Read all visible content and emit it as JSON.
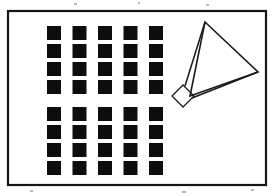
{
  "figure": {
    "title": "",
    "background_color": "#ffffff",
    "ink_color": "#111111",
    "canvas": {
      "width": 275,
      "height": 196
    },
    "frame": {
      "label": "outer-frame",
      "x": 8,
      "y": 11,
      "width": 258,
      "height": 174,
      "stroke_width": 2.2,
      "stroke_color": "#141414",
      "fill": "none"
    },
    "square_grid": {
      "label": "filled-square-grid",
      "columns": 5,
      "rows": 8,
      "square_size": 14,
      "column_pitch": 25.5,
      "row_pitch": 18,
      "origin_x": 47,
      "origin_y": 26,
      "block_gap": 9,
      "rows_per_block": 4,
      "blocks": 2,
      "fill_color": "#0d0d0d",
      "total_squares": 40
    },
    "triangle": {
      "label": "outlined-triangle",
      "points": [
        {
          "name": "apex",
          "x": 205,
          "y": 22
        },
        {
          "name": "right-vertex",
          "x": 258,
          "y": 72
        },
        {
          "name": "lower-left-vertex",
          "x": 190,
          "y": 96
        }
      ],
      "stroke_width": 1.6,
      "stroke_color": "#1a1a1a",
      "fill": "none"
    },
    "diamond": {
      "label": "rotated-square-marker",
      "center_x": 183,
      "center_y": 96,
      "half_diagonal": 11,
      "rotation_degrees": 45,
      "stroke_width": 1.3,
      "stroke_color": "#1a1a1a",
      "fill": "none"
    },
    "connector_edges": [
      {
        "name": "apex-to-diamond-top",
        "x1": 205,
        "y1": 22,
        "x2": 185,
        "y2": 86
      },
      {
        "name": "diamond-right-to-triangle-base",
        "x1": 192,
        "y1": 98,
        "x2": 258,
        "y2": 72
      }
    ],
    "specks": [
      {
        "x": 74,
        "y": 3,
        "width": 3,
        "height": 2
      },
      {
        "x": 138,
        "y": 2,
        "width": 2,
        "height": 2
      },
      {
        "x": 206,
        "y": 4,
        "width": 3,
        "height": 2
      },
      {
        "x": 30,
        "y": 190,
        "width": 3,
        "height": 2
      },
      {
        "x": 182,
        "y": 191,
        "width": 4,
        "height": 2
      },
      {
        "x": 251,
        "y": 189,
        "width": 3,
        "height": 2
      }
    ]
  }
}
